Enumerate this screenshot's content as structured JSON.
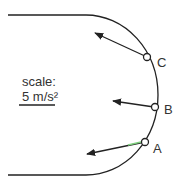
{
  "diagram": {
    "scale_label": "scale:",
    "scale_value": "5 m/s²",
    "points": [
      {
        "id": "C",
        "label": "C"
      },
      {
        "id": "B",
        "label": "B"
      },
      {
        "id": "A",
        "label": "A"
      }
    ],
    "colors": {
      "line": "#222222",
      "point_fill": "#ffffff",
      "accent_green": "#7fd07f"
    }
  }
}
